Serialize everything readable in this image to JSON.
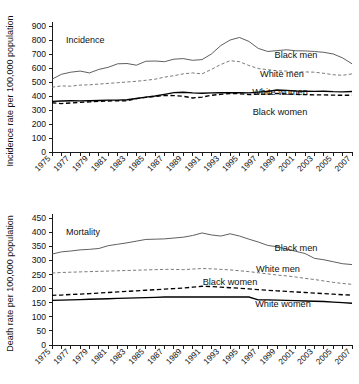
{
  "chart_data": [
    {
      "type": "line",
      "title": "Incidence",
      "xlabel": "",
      "ylabel": "Incidence rate per 100,000 population",
      "ylim": [
        0,
        900
      ],
      "yticks": [
        0,
        100,
        200,
        300,
        400,
        500,
        600,
        700,
        800,
        900
      ],
      "grid": false,
      "legend_position": "inline-right",
      "x": [
        1975,
        1976,
        1977,
        1978,
        1979,
        1980,
        1981,
        1982,
        1983,
        1984,
        1985,
        1986,
        1987,
        1988,
        1989,
        1990,
        1991,
        1992,
        1993,
        1994,
        1995,
        1996,
        1997,
        1998,
        1999,
        2000,
        2001,
        2002,
        2003,
        2004,
        2005,
        2006,
        2007
      ],
      "xtick_labels": [
        "1975",
        "1977",
        "1979",
        "1981",
        "1983",
        "1985",
        "1987",
        "1989",
        "1991",
        "1993",
        "1995",
        "1997",
        "1999",
        "2001",
        "2003",
        "2005",
        "2007"
      ],
      "series": [
        {
          "name": "Black men",
          "style": "solid-thin",
          "label": "Black men",
          "values": [
            520,
            555,
            570,
            578,
            565,
            590,
            605,
            630,
            632,
            620,
            648,
            650,
            645,
            663,
            667,
            655,
            660,
            700,
            760,
            800,
            818,
            790,
            740,
            718,
            724,
            730,
            723,
            722,
            718,
            712,
            700,
            672,
            630
          ]
        },
        {
          "name": "White men",
          "style": "dash-thin",
          "label": "White men",
          "values": [
            463,
            472,
            470,
            478,
            480,
            485,
            490,
            495,
            500,
            505,
            512,
            520,
            535,
            545,
            558,
            565,
            558,
            590,
            625,
            652,
            645,
            618,
            596,
            588,
            580,
            578,
            572,
            572,
            570,
            562,
            552,
            548,
            558
          ]
        },
        {
          "name": "White women",
          "style": "solid-thick",
          "label": "White women",
          "values": [
            362,
            364,
            366,
            365,
            366,
            368,
            370,
            371,
            373,
            382,
            392,
            400,
            412,
            424,
            427,
            422,
            420,
            422,
            424,
            423,
            424,
            422,
            428,
            432,
            443,
            440,
            436,
            434,
            433,
            434,
            431,
            430,
            432
          ]
        },
        {
          "name": "Black women",
          "style": "dash-thick",
          "label": "Black women",
          "values": [
            352,
            346,
            350,
            355,
            358,
            362,
            364,
            366,
            365,
            381,
            390,
            396,
            404,
            403,
            398,
            386,
            392,
            405,
            412,
            418,
            416,
            410,
            414,
            412,
            418,
            414,
            412,
            410,
            408,
            408,
            406,
            405,
            406
          ]
        }
      ]
    },
    {
      "type": "line",
      "title": "Mortality",
      "xlabel": "",
      "ylabel": "Death rate per 100,000 population",
      "ylim": [
        0,
        450
      ],
      "yticks": [
        0,
        50,
        100,
        150,
        200,
        250,
        300,
        350,
        400,
        450
      ],
      "grid": false,
      "legend_position": "inline-right",
      "x": [
        1975,
        1976,
        1977,
        1978,
        1979,
        1980,
        1981,
        1982,
        1983,
        1984,
        1985,
        1986,
        1987,
        1988,
        1989,
        1990,
        1991,
        1992,
        1993,
        1994,
        1995,
        1996,
        1997,
        1998,
        1999,
        2000,
        2001,
        2002,
        2003,
        2004,
        2005,
        2006,
        2007
      ],
      "xtick_labels": [
        "1975",
        "1977",
        "1979",
        "1981",
        "1983",
        "1985",
        "1987",
        "1989",
        "1991",
        "1993",
        "1995",
        "1997",
        "1999",
        "2001",
        "2003",
        "2005",
        "2007"
      ],
      "series": [
        {
          "name": "Black men",
          "style": "solid-thin",
          "label": "Black men",
          "values": [
            322,
            330,
            333,
            337,
            339,
            342,
            352,
            357,
            362,
            368,
            374,
            375,
            376,
            379,
            382,
            388,
            397,
            390,
            386,
            394,
            386,
            375,
            365,
            353,
            348,
            340,
            332,
            324,
            307,
            302,
            295,
            288,
            285
          ]
        },
        {
          "name": "White men",
          "style": "dash-thin",
          "label": "White men",
          "values": [
            255,
            257,
            258,
            259,
            260,
            261,
            262,
            263,
            264,
            265,
            266,
            267,
            268,
            268,
            267,
            269,
            271,
            270,
            268,
            266,
            263,
            260,
            256,
            252,
            248,
            245,
            241,
            236,
            232,
            227,
            222,
            218,
            215
          ]
        },
        {
          "name": "Black women",
          "style": "dash-thick",
          "label": "Black women",
          "values": [
            176,
            177,
            179,
            180,
            182,
            184,
            186,
            188,
            190,
            192,
            194,
            196,
            198,
            200,
            202,
            205,
            208,
            207,
            205,
            203,
            201,
            199,
            196,
            194,
            192,
            190,
            188,
            186,
            184,
            182,
            180,
            178,
            177
          ]
        },
        {
          "name": "White women",
          "style": "solid-thick",
          "label": "White women",
          "values": [
            158,
            159,
            160,
            161,
            162,
            163,
            164,
            165,
            166,
            167,
            168,
            169,
            170,
            170,
            170,
            170,
            170,
            170,
            170,
            170,
            170,
            170,
            160,
            160,
            159,
            158,
            157,
            156,
            155,
            154,
            152,
            150,
            148
          ]
        }
      ]
    }
  ],
  "panels": {
    "top": {
      "title": "Incidence",
      "ylabel": "Incidence rate per 100,000 population",
      "labels": {
        "black_men": "Black men",
        "white_men": "White men",
        "white_women": "White women",
        "black_women": "Black women"
      }
    },
    "bottom": {
      "title": "Mortality",
      "ylabel": "Death rate per 100,000 population",
      "labels": {
        "black_men": "Black men",
        "white_men": "White men",
        "black_women": "Black women",
        "white_women": "White women"
      }
    }
  }
}
